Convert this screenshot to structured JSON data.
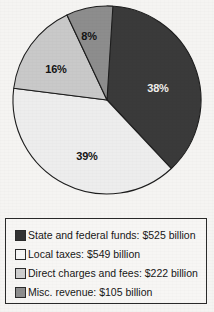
{
  "chart_data": {
    "type": "pie",
    "title": "",
    "categories": [
      "State and federal funds",
      "Local taxes",
      "Direct charges and fees",
      "Misc. revenue"
    ],
    "values": [
      525,
      549,
      222,
      105
    ],
    "value_unit": "billion dollars",
    "percentages": [
      38,
      39,
      16,
      8
    ],
    "slice_labels": [
      "38%",
      "39%",
      "16%",
      "8%"
    ],
    "colors": [
      "#3a3a3a",
      "#ededed",
      "#c9c9c9",
      "#8d8d8d"
    ],
    "start_angle_deg": 0,
    "direction": "clockwise",
    "legend_position": "bottom",
    "legend_entries": [
      "State and federal funds: $525 billion",
      "Local taxes: $549 billion",
      "Direct charges and fees: $222 billion",
      "Misc. revenue: $105 billion"
    ]
  },
  "pie": {
    "slices": [
      {
        "label": "38%",
        "color": "#3a3a3a",
        "label_x": 158,
        "label_y": 92,
        "label_tone": "dark-bg"
      },
      {
        "label": "39%",
        "color": "#ededed",
        "label_x": 87,
        "label_y": 160,
        "label_tone": "light-bg"
      },
      {
        "label": "16%",
        "color": "#c9c9c9",
        "label_x": 56,
        "label_y": 73,
        "label_tone": "light-bg"
      },
      {
        "label": "8%",
        "color": "#8d8d8d",
        "label_x": 89,
        "label_y": 40,
        "label_tone": "light-bg"
      }
    ]
  },
  "legend": {
    "items": [
      {
        "swatch_color": "#333333",
        "text": "State and federal funds: $525 billion"
      },
      {
        "swatch_color": "#f6f6f6",
        "text": "Local taxes: $549 billion"
      },
      {
        "swatch_color": "#cfcfcf",
        "text": "Direct charges and fees: $222 billion"
      },
      {
        "swatch_color": "#8d8d8d",
        "text": "Misc. revenue: $105 billion"
      }
    ]
  }
}
